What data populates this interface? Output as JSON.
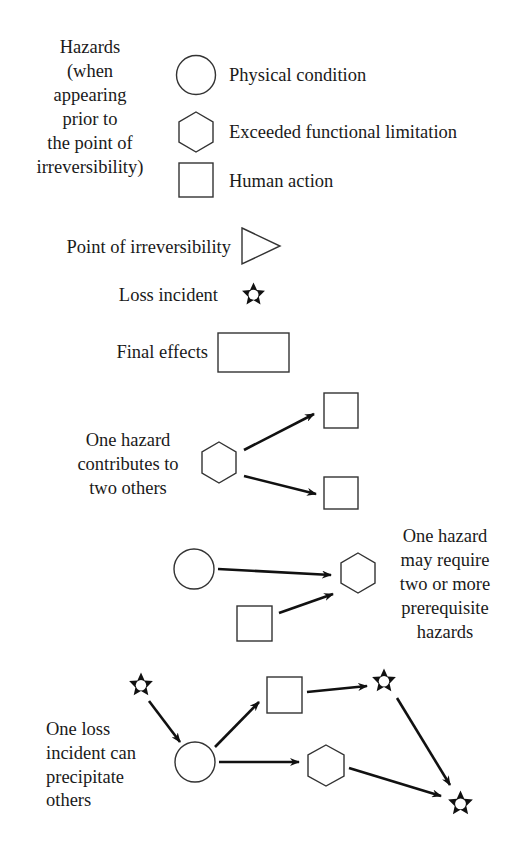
{
  "legend": {
    "hazards_label": [
      "Hazards",
      "(when",
      "appearing",
      "prior to",
      "the point of",
      "irreversibility)"
    ],
    "items": [
      {
        "shape": "circle",
        "label": "Physical condition"
      },
      {
        "shape": "hexagon",
        "label": "Exceeded functional limitation"
      },
      {
        "shape": "square",
        "label": "Human action"
      }
    ],
    "point_of_irreversibility": {
      "shape": "triangle",
      "label": "Point of irreversibility"
    },
    "loss_incident": {
      "shape": "star",
      "label": "Loss incident"
    },
    "final_effects": {
      "shape": "rectangle",
      "label": "Final effects"
    }
  },
  "examples": [
    {
      "id": "contributes",
      "caption": [
        "One hazard",
        "contributes to",
        "two others"
      ],
      "nodes": [
        {
          "id": "h1",
          "shape": "hexagon"
        },
        {
          "id": "s1",
          "shape": "square"
        },
        {
          "id": "s2",
          "shape": "square"
        }
      ],
      "edges": [
        [
          "h1",
          "s1"
        ],
        [
          "h1",
          "s2"
        ]
      ]
    },
    {
      "id": "prerequisites",
      "caption": [
        "One hazard",
        "may require",
        "two or more",
        "prerequisite",
        "hazards"
      ],
      "nodes": [
        {
          "id": "c1",
          "shape": "circle"
        },
        {
          "id": "s1",
          "shape": "square"
        },
        {
          "id": "h1",
          "shape": "hexagon"
        }
      ],
      "edges": [
        [
          "c1",
          "h1"
        ],
        [
          "s1",
          "h1"
        ]
      ]
    },
    {
      "id": "precipitate",
      "caption": [
        "One loss",
        "incident can",
        "precipitate",
        "others"
      ],
      "nodes": [
        {
          "id": "st1",
          "shape": "star"
        },
        {
          "id": "c1",
          "shape": "circle"
        },
        {
          "id": "s1",
          "shape": "square"
        },
        {
          "id": "h1",
          "shape": "hexagon"
        },
        {
          "id": "st2",
          "shape": "star"
        },
        {
          "id": "st3",
          "shape": "star"
        }
      ],
      "edges": [
        [
          "st1",
          "c1"
        ],
        [
          "c1",
          "s1"
        ],
        [
          "c1",
          "h1"
        ],
        [
          "s1",
          "st2"
        ],
        [
          "st2",
          "st3"
        ],
        [
          "h1",
          "st3"
        ]
      ]
    }
  ],
  "colors": {
    "stroke": "#333333",
    "arrow": "#111111",
    "text": "#1a1a1a",
    "background": "#ffffff"
  }
}
